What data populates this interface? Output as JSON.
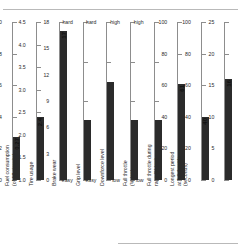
{
  "chart_data": {
    "type": "bar",
    "title": "",
    "subtitle": "",
    "xlabel": "",
    "ylabel": "",
    "grid": false,
    "legend": "none",
    "orientation": "vertical-gauges",
    "note": "Ten independent vertical gauge bars, each with its own axis scale and units.",
    "categories": [
      "Fuel effect\n(seconds/10kg)",
      "Fuel consumption\n(kg/lap)",
      "Fuel consumption\n(of 18 circuits)",
      "Tire usage",
      "Brake wear",
      "Grip level",
      "Downforce level",
      "Full throttle\n(% lap)",
      "Full throttle during\nrace (% lap)",
      "Longest period\nat full throttle\n(seconds)"
    ],
    "values": [
      0.27,
      2.4,
      17,
      null,
      null,
      null,
      null,
      61,
      40,
      16
    ],
    "value_labels": [
      "0.27",
      "2.4",
      "17",
      "",
      "",
      "",
      "",
      "61",
      "40",
      "16"
    ],
    "gauges": [
      {
        "name": "Fuel effect (seconds/10kg)",
        "label_lines": [
          "Fuel effect",
          "(seconds/10kg)"
        ],
        "scale": "numeric",
        "min": 0,
        "max": 1.0,
        "value": 0.27,
        "value_label": "0.27",
        "ticks": [
          "1.0",
          "0.8",
          "0.6",
          "0.4",
          "0.2",
          "0"
        ],
        "tick_values": [
          1.0,
          0.8,
          0.6,
          0.4,
          0.2,
          0
        ],
        "minor_ticks": []
      },
      {
        "name": "Fuel consumption (kg/lap)",
        "label_lines": [
          "Fuel consumption",
          "(kg/lap)"
        ],
        "scale": "numeric",
        "min": 1.0,
        "max": 4.5,
        "value": 2.4,
        "value_label": "2.4",
        "ticks": [
          "4.5",
          "4.0",
          "3.5",
          "3.0",
          "2.5",
          "2.0",
          "1.5",
          "1.0"
        ],
        "tick_values": [
          4.5,
          4.0,
          3.5,
          3.0,
          2.5,
          2.0,
          1.5,
          1.0
        ],
        "minor_ticks": []
      },
      {
        "name": "Fuel consumption (of 18 circuits)",
        "label_lines": [
          "Fuel consumption",
          "(of 18 circuits)"
        ],
        "scale": "numeric",
        "min": 0,
        "max": 18,
        "value": 17,
        "value_label": "17",
        "ticks": [
          "18",
          "15",
          "12",
          "9",
          "6",
          "3",
          "0"
        ],
        "tick_values": [
          18,
          15,
          12,
          9,
          6,
          3,
          0
        ],
        "minor_ticks": [
          17,
          16,
          14,
          13,
          11,
          10,
          8,
          7,
          5,
          4,
          2,
          1
        ]
      },
      {
        "name": "Tire usage",
        "label_lines": [
          "Tire usage"
        ],
        "scale": "qualitative",
        "min": 0,
        "max": 1,
        "value": 0.38,
        "value_label": "",
        "ticks": [
          "hard",
          "",
          "",
          "",
          "easy"
        ],
        "tick_values": [
          1,
          0.75,
          0.5,
          0.25,
          0
        ],
        "minor_ticks": []
      },
      {
        "name": "Brake wear",
        "label_lines": [
          "Brake wear"
        ],
        "scale": "qualitative",
        "min": 0,
        "max": 1,
        "value": 0.62,
        "value_label": "",
        "ticks": [
          "hard",
          "",
          "",
          "",
          "easy"
        ],
        "tick_values": [
          1,
          0.75,
          0.5,
          0.25,
          0
        ],
        "minor_ticks": []
      },
      {
        "name": "Grip level",
        "label_lines": [
          "Grip level"
        ],
        "scale": "qualitative",
        "min": 0,
        "max": 1,
        "value": 0.38,
        "value_label": "",
        "ticks": [
          "high",
          "",
          "",
          "",
          "low"
        ],
        "tick_values": [
          1,
          0.75,
          0.5,
          0.25,
          0
        ],
        "minor_ticks": []
      },
      {
        "name": "Downforce level",
        "label_lines": [
          "Downforce level"
        ],
        "scale": "qualitative",
        "min": 0,
        "max": 1,
        "value": 0.38,
        "value_label": "",
        "ticks": [
          "high",
          "",
          "",
          "",
          "low"
        ],
        "tick_values": [
          1,
          0.75,
          0.5,
          0.25,
          0
        ],
        "minor_ticks": []
      },
      {
        "name": "Full throttle (% lap)",
        "label_lines": [
          "Full throttle",
          "(% lap)"
        ],
        "scale": "numeric",
        "min": 0,
        "max": 100,
        "value": 61,
        "value_label": "61",
        "ticks": [
          "100",
          "80",
          "60",
          "40",
          "20",
          "0"
        ],
        "tick_values": [
          100,
          80,
          60,
          40,
          20,
          0
        ],
        "minor_ticks": []
      },
      {
        "name": "Full throttle during race (% lap)",
        "label_lines": [
          "Full throttle during",
          "race (% lap)"
        ],
        "scale": "numeric",
        "min": 0,
        "max": 100,
        "value": 40,
        "value_label": "40",
        "ticks": [
          "100",
          "80",
          "60",
          "40",
          "20",
          "0"
        ],
        "tick_values": [
          100,
          80,
          60,
          40,
          20,
          0
        ],
        "minor_ticks": []
      },
      {
        "name": "Longest period at full throttle (seconds)",
        "label_lines": [
          "Longest period",
          "at full throttle",
          "(seconds)"
        ],
        "scale": "numeric",
        "min": 0,
        "max": 25,
        "value": 16,
        "value_label": "16",
        "ticks": [
          "25",
          "20",
          "15",
          "10",
          "5",
          "0"
        ],
        "tick_values": [
          25,
          20,
          15,
          10,
          5,
          0
        ],
        "minor_ticks": []
      }
    ],
    "colors": {
      "bar": "#2b2b2b",
      "axis": "#8d8d8d",
      "text": "#2a2a2a",
      "rule": "#b9b9b9",
      "background": "#ffffff"
    }
  }
}
